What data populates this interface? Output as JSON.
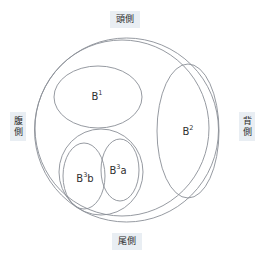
{
  "diagram": {
    "type": "nested-ellipse-schematic",
    "orientation_labels": {
      "top": {
        "name": "cranial",
        "text": "頭側",
        "chars": [
          "頭",
          "側"
        ]
      },
      "bottom": {
        "name": "caudal",
        "text": "尾側",
        "chars": [
          "尾",
          "側"
        ]
      },
      "left": {
        "name": "ventral",
        "text": "腹側",
        "chars": [
          "腹",
          "側"
        ]
      },
      "right": {
        "name": "dorsal",
        "text": "背側",
        "chars": [
          "背",
          "側"
        ]
      }
    },
    "segments": [
      {
        "id": "b1",
        "base": "B",
        "sup": "1",
        "suffix": ""
      },
      {
        "id": "b2",
        "base": "B",
        "sup": "2",
        "suffix": ""
      },
      {
        "id": "b3a",
        "base": "B",
        "sup": "3",
        "suffix": "a"
      },
      {
        "id": "b3b",
        "base": "B",
        "sup": "3",
        "suffix": "b"
      }
    ],
    "colors": {
      "stroke": "#8a8f96",
      "label_background": "#e9eef3",
      "label_text": "#2b2b2b",
      "segment_text": "#2f2f2f",
      "canvas": "#ffffff"
    }
  }
}
